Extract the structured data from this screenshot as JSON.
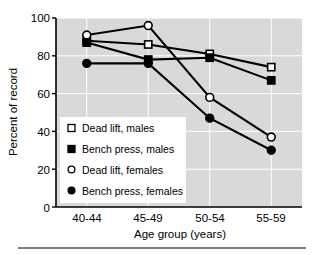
{
  "chart_data": {
    "type": "line",
    "title": "",
    "xlabel": "Age group (years)",
    "ylabel": "Percent of record",
    "categories": [
      "40-44",
      "45-49",
      "50-54",
      "55-59"
    ],
    "ylim": [
      0,
      100
    ],
    "yticks": [
      0,
      20,
      40,
      60,
      80,
      100
    ],
    "ytick_labels": [
      "0",
      "20",
      "40",
      "60",
      "80",
      "100"
    ],
    "grid": true,
    "legend_position": "lower-left-inside",
    "plot_background": "#d9d9d9",
    "line_color": "#000000",
    "series": [
      {
        "name": "Dead lift, males",
        "marker": "open-square",
        "values": [
          88,
          86,
          81,
          74
        ]
      },
      {
        "name": "Bench press, males",
        "marker": "filled-square",
        "values": [
          87,
          78,
          79,
          67
        ]
      },
      {
        "name": "Dead lift, females",
        "marker": "open-circle",
        "values": [
          91,
          96,
          58,
          37
        ]
      },
      {
        "name": "Bench press, females",
        "marker": "filled-circle",
        "values": [
          76,
          76,
          47,
          30
        ]
      }
    ]
  },
  "axis": {
    "ylabel": "Percent of record",
    "xlabel": "Age group (years)",
    "ytick_0": "0",
    "ytick_1": "20",
    "ytick_2": "40",
    "ytick_3": "60",
    "ytick_4": "80",
    "ytick_5": "100",
    "xtick_0": "40-44",
    "xtick_1": "45-49",
    "xtick_2": "50-54",
    "xtick_3": "55-59"
  },
  "legend": {
    "item_0": "Dead lift, males",
    "item_1": "Bench press, males",
    "item_2": "Dead lift, females",
    "item_3": "Bench press, females"
  }
}
